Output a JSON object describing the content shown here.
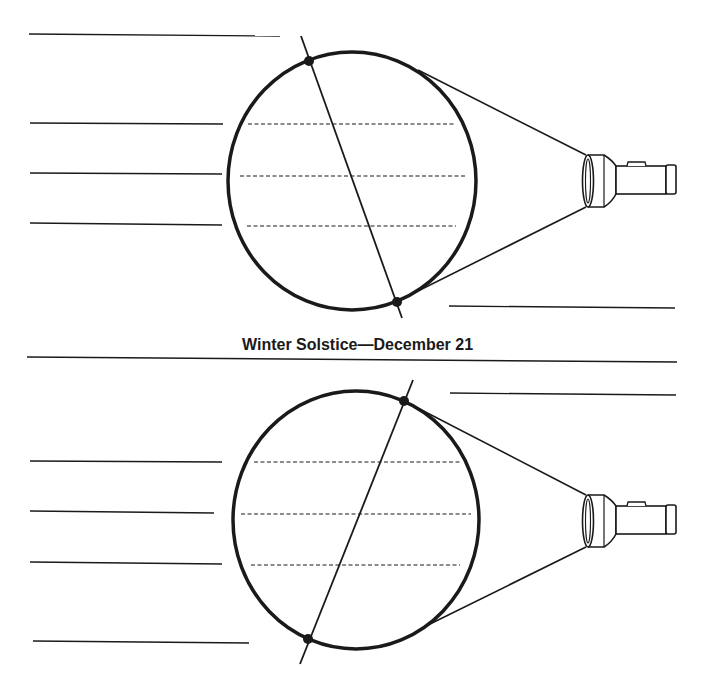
{
  "caption": "Winter Solstice—December 21",
  "colors": {
    "ink": "#1a1a1a",
    "paper": "#ffffff"
  },
  "diagrams": [
    {
      "name": "top-diagram",
      "globe": {
        "cx": 352,
        "cy": 181,
        "rx": 124,
        "ry": 129
      },
      "axis": {
        "x1": 301,
        "y1": 36,
        "x2": 402,
        "y2": 318
      },
      "poles": [
        {
          "x": 309,
          "y": 61
        },
        {
          "x": 397,
          "y": 302
        }
      ],
      "latitudes": [
        {
          "x1": 248,
          "x2": 456,
          "y": 124
        },
        {
          "x1": 240,
          "x2": 466,
          "y": 176
        },
        {
          "x1": 247,
          "x2": 456,
          "y": 226
        }
      ],
      "beam": [
        {
          "x1": 418,
          "y1": 70,
          "x2": 586,
          "y2": 155
        },
        {
          "x1": 400,
          "y1": 300,
          "x2": 586,
          "y2": 207
        }
      ],
      "flashlight_offset_y": 0,
      "label_lines": [
        {
          "x1": 29,
          "y1": 34,
          "x2": 280,
          "y2": 36
        },
        {
          "x1": 30,
          "y1": 123,
          "x2": 223,
          "y2": 124
        },
        {
          "x1": 30,
          "y1": 173,
          "x2": 222,
          "y2": 174
        },
        {
          "x1": 30,
          "y1": 223,
          "x2": 222,
          "y2": 225
        },
        {
          "x1": 449,
          "y1": 306,
          "x2": 675,
          "y2": 308
        }
      ]
    },
    {
      "name": "bottom-diagram",
      "globe": {
        "cx": 356,
        "cy": 520,
        "rx": 123,
        "ry": 129
      },
      "axis": {
        "x1": 413,
        "y1": 380,
        "x2": 300,
        "y2": 664
      },
      "poles": [
        {
          "x": 404,
          "y": 401
        },
        {
          "x": 308,
          "y": 639
        }
      ],
      "latitudes": [
        {
          "x1": 254,
          "x2": 460,
          "y": 462
        },
        {
          "x1": 241,
          "x2": 471,
          "y": 514
        },
        {
          "x1": 251,
          "x2": 460,
          "y": 565
        }
      ],
      "beam": [
        {
          "x1": 408,
          "y1": 403,
          "x2": 586,
          "y2": 495
        },
        {
          "x1": 428,
          "y1": 625,
          "x2": 586,
          "y2": 547
        }
      ],
      "flashlight_offset_y": 340,
      "label_lines": [
        {
          "x1": 450,
          "y1": 393,
          "x2": 676,
          "y2": 395
        },
        {
          "x1": 30,
          "y1": 461,
          "x2": 222,
          "y2": 462
        },
        {
          "x1": 30,
          "y1": 511,
          "x2": 214,
          "y2": 513
        },
        {
          "x1": 30,
          "y1": 562,
          "x2": 222,
          "y2": 564
        },
        {
          "x1": 33,
          "y1": 641,
          "x2": 249,
          "y2": 643
        }
      ]
    }
  ],
  "separator": {
    "x1": 27,
    "y1": 357,
    "x2": 677,
    "y2": 362
  }
}
